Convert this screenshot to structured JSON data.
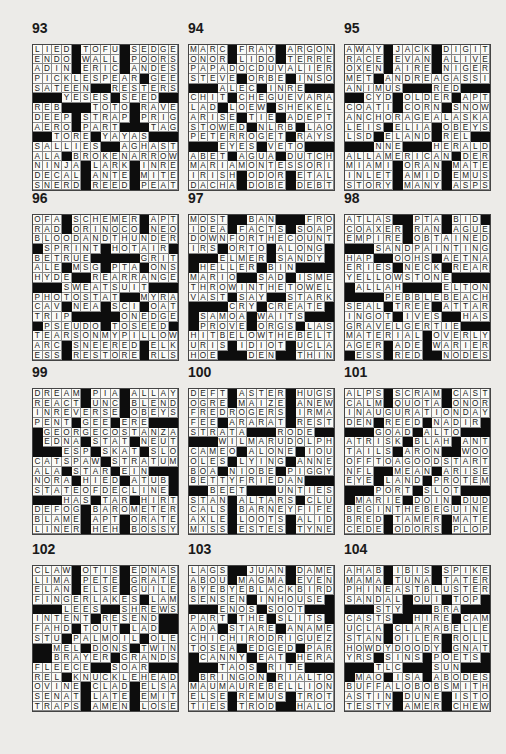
{
  "page": {
    "black_square_symbol": "#"
  },
  "puzzles": [
    {
      "number": "93",
      "left": 32,
      "top": 44,
      "rows": [
        "LIED#TOFU#SEDGE",
        "ENDO#WALL#POORS",
        "ADIN#ERIC#ANDES",
        "PICKLESPEAR#GEE",
        "SATEEN##RESTERS",
        "###YESES#SEED##",
        "REB###TOTO#RAVE",
        "DEEP#STRAP#PRIG",
        "AERO#PART###TAG",
        "##TORE#YAYAS###",
        "SALLIES##AGHAST",
        "ALA#BROKENARROW",
        "NINJA#LARK#INRE",
        "DECAL#ANTE#MITE",
        "SNERD#REED#PEAT"
      ]
    },
    {
      "number": "94",
      "left": 188,
      "top": 44,
      "rows": [
        "MARC#FRAY#ARGON",
        "ONOR#LIDO#TERRE",
        "PAPADOCDUVALIER",
        "STEVE#ORBE#INSO",
        "###ALEC#INRE###",
        "CHIT#CHEGUEVARA",
        "LAD#LOEW#SHEKEL",
        "ARISE#TIE#ADEPT",
        "STOWED#NLRB#LAO",
        "PETERROGET#RAYS",
        "###EYES#VETO###",
        "ABET#AGUA#DUTCH",
        "MARIAMONTESSORI",
        "IRISH#ODOR#ETAL",
        "DACHA#DOBE#DEBT"
      ]
    },
    {
      "number": "95",
      "left": 344,
      "top": 44,
      "rows": [
        "AWAY#JACK#DIGIT",
        "RACE#EVAN#ALIVE",
        "OXEN#AIRE#NIGER",
        "MET#ANDREAGASSI",
        "ANIMUS###RED###",
        "##CYD#OLDER#APT",
        "COATI#CORN#SNOW",
        "ANCHORAGEALASKA",
        "LEIS#ELIA#OBEYS",
        "LSD#ELAND#REL##",
        "###NNE###HERALD",
        "ALLAMERICAN#DER",
        "MIAMI#ORAN#MATE",
        "INLET#AMID#EMUS",
        "STORY#MANY#ASPS"
      ]
    },
    {
      "number": "96",
      "left": 32,
      "top": 214,
      "rows": [
        "OFA#SCHEMER#APT",
        "RAD#ORINOCO#NEO",
        "BLOODANDTHUNDER",
        "#SPRINT#HOTAIR#",
        "BETRUE#####GRIT",
        "ALE#MSG#PTA#ONS",
        "HYDE##REARRANGE",
        "###SWEATSUIT###",
        "PHOTOSTAT##MYRA",
        "CAV#NEA#SCI#OAT",
        "TRIP#####ONEDGE",
        "#PSEUDO#TOSEED#",
        "TEARSONMYPILLOW",
        "ARC#SNEERED#ELK",
        "ESS#RESTORE#RLS"
      ]
    },
    {
      "number": "97",
      "left": 188,
      "top": 214,
      "rows": [
        "MOST##BAN###FRO",
        "IDEA#FACTS#SOAP",
        "DOWNFORTHECOUNT",
        "IRS#ORTO#ALONG#",
        "###ELMER#SANDY#",
        "#HELLER#BIN####",
        "MARIO##SAD#ISME",
        "THROWINTHETOWEL",
        "VAST#SAY##STARK",
        "####CRY#CREATE#",
        "#SAMOA#WAITS###",
        "#PROVE#ORGS#LAS",
        "HITBELOWTHEBELT",
        "URIS#IDIOT#UCLA",
        "HOE###DEN##THIN"
      ]
    },
    {
      "number": "98",
      "left": 344,
      "top": 214,
      "rows": [
        "ATLAS##PTA#BID#",
        "COAXER#RAN#AGUE",
        "EMPIRE#OBTAINED",
        "###SANDPAINTING",
        "HAP##OOHS#AETNA",
        "ERIES#NECK#REAR",
        "YELLOWSTONE####",
        "#ALLAH####ELTON",
        "####PEBBLEBEACH",
        "SEAL#TREE#ATTAR",
        "INGOT#IVES##HAS",
        "GRAVELGERTIE###",
        "MATERIAL#OVERLY",
        "AGER#ADE#WARIER",
        "#ESS#RED##NODES"
      ]
    },
    {
      "number": "99",
      "left": 32,
      "top": 388,
      "rows": [
        "DREAM#PIA#ALLAY",
        "REACT#UNC#BLEND",
        "INREVERSE#OBEYS",
        "PENT#GEE#ERE###",
        "#GEORGECOSTANZA",
        "#EDNA#STAT#NEUT",
        "###ESP#SKAT#SLO",
        "CATSPAW#STRATUM",
        "ALA#STAR#EIN###",
        "NORA#HIED#ATUB#",
        "STATEOFDECLINE#",
        "###HAS#TAR#HIRT",
        "DEFOG#BAROMETER",
        "BLAME#APT#ORATE",
        "LINER#HEH#BOSSY"
      ]
    },
    {
      "number": "100",
      "left": 188,
      "top": 388,
      "rows": [
        "DEFT#ASTER#HUGS",
        "OGRE#MAIZE#ANEW",
        "FREDROGERS#IRMA",
        "FEE#ARARAT#REST",
        "STRATA###RODE##",
        "###WILMARUDOLPH",
        "CAMEO#ALONE#IOU",
        "OLES#LYING#ANNE",
        "BOA#NIOBE#PIGGY",
        "BETTYFRIEDAN###",
        "##BEET###UNTIES",
        "STAN#ALTARS#CLU",
        "CALS#BARNEYFIFE",
        "AXLE#LOOTS#ALID",
        "MISS#ESTES#TYNE"
      ]
    },
    {
      "number": "101",
      "left": 344,
      "top": 388,
      "rows": [
        "ALPS#SCRAM#CAST",
        "CALM#QUOTA#ONOR",
        "INAUGURATIONDAY",
        "DEN#REED#NADIR#",
        "###GOAD#ALTO###",
        "ATRISK#BLAH#ANT",
        "TAILS#ARON##WOO",
        "OFFTOAGOODSTART",
        "NFL##MEAN#ARISE",
        "EYE#LAND#PROTEM",
        "###PORT#SLOT###",
        "#MARIE#DOIN#DUD",
        "BEGINTHEBEGUINE",
        "BRED#TAMER#MATE",
        "CEDE#ODORS#PLOP"
      ]
    },
    {
      "number": "102",
      "left": 32,
      "top": 565,
      "rows": [
        "CLAW#OTIS#EDNAS",
        "LIMA#PETE#GRATE",
        "ELAN#ELSE#GUILE",
        "FINGERLAKES#LAM",
        "###LEES##SHREWS",
        "INTENT#RESEND##",
        "FAHD#TOUT#LAD##",
        "STU#PALMOIL#OLE",
        "##MEL#DONS#TWIN",
        "##BRAYER#GRANDS",
        "FLEECE##SOAR###",
        "REL#KNUCKLEHEAD",
        "OVINE#CLAD#ELSA",
        "SENAT#LATE#EMIT",
        "TRAPS#AMEN#LOSE"
      ]
    },
    {
      "number": "103",
      "left": 188,
      "top": 565,
      "rows": [
        "LAGS##JUAN#DAME",
        "ABOU#MAGMA#EVEN",
        "BYEBYEBLACKBIRD",
        "SENSEN#INHOUSE#",
        "###ENOS#SOOT###",
        "PART#THE#SLITS#",
        "ADA#STARE#ANAME",
        "CHICHIRODRIGUEZ",
        "TOSEA#EDGED#PAR",
        "#CANNY#EAT#HERA",
        "###TAOS#RITE###",
        "#BRINGON#RIALTO",
        "MAUMAUREBELLION",
        "ELSE#REMUS#TROT",
        "TIES#TROD##HALO"
      ]
    },
    {
      "number": "104",
      "left": 344,
      "top": 565,
      "rows": [
        "AHAB#IBIS#SPIKE",
        "MAMA#TUNA#TATER",
        "PHINEASTBLUSTER",
        "SANDAL#OUI#TOP#",
        "###STY###BRA###",
        "CASTS##HIRE#CAM",
        "UCLA#CLARABELLE",
        "STAN#OILER#ROLL",
        "HOWDYDOODY#GNAT",
        "YRS#SINS#POETS#",
        "###TLC###SUN###",
        "#MAO#ISA#ABODES",
        "BUFFALOBOBSMITH",
        "ASTIN#DUNE#ISTO",
        "TESTY#AMER#CHEW"
      ]
    }
  ]
}
